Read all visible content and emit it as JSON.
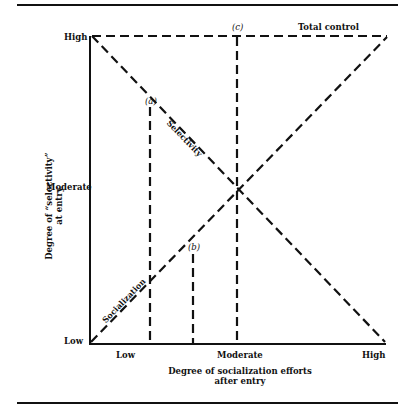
{
  "diagram": {
    "y_axis": {
      "title_line1": "Degree of “selectivity”",
      "title_line2": "at entry",
      "ticks": [
        "High",
        "Moderate",
        "Low"
      ]
    },
    "x_axis": {
      "title_line1": "Degree of socialization efforts",
      "title_line2": "after entry",
      "ticks": [
        "Low",
        "Moderate",
        "High"
      ]
    },
    "lines": {
      "selectivity": "Selectivity",
      "socialization": "Socialization",
      "total_control": "Total control"
    },
    "points": {
      "a": "(a)",
      "b": "(b)",
      "c": "(c)"
    },
    "colors": {
      "ink": "#111111",
      "background": "#ffffff"
    }
  }
}
